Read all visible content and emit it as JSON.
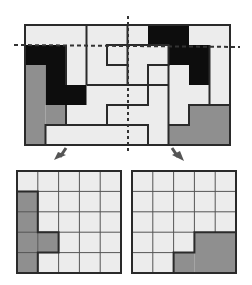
{
  "colors": {
    "light": "#ececec",
    "black": "#0d0d0d",
    "gray": "#8f8f8f",
    "line": "#2a2a2a",
    "arrow": "#555555"
  },
  "top_puzzle": {
    "cols": 10,
    "rows": 6,
    "pieces": [
      {
        "name": "black-piece-left",
        "fill": "black",
        "cells": [
          [
            0,
            1
          ],
          [
            1,
            1
          ],
          [
            1,
            2
          ],
          [
            1,
            3
          ],
          [
            2,
            3
          ]
        ]
      },
      {
        "name": "gray-piece-left",
        "fill": "gray",
        "cells": [
          [
            0,
            2
          ],
          [
            0,
            3
          ],
          [
            0,
            4
          ],
          [
            1,
            4
          ],
          [
            0,
            5
          ]
        ]
      },
      {
        "name": "black-piece-right",
        "fill": "black",
        "cells": [
          [
            6,
            0
          ],
          [
            7,
            0
          ],
          [
            7,
            1
          ],
          [
            8,
            1
          ],
          [
            8,
            2
          ]
        ]
      },
      {
        "name": "gray-piece-right",
        "fill": "gray",
        "cells": [
          [
            8,
            4
          ],
          [
            9,
            4
          ],
          [
            7,
            5
          ],
          [
            8,
            5
          ],
          [
            9,
            5
          ]
        ]
      }
    ],
    "cut_lines": [
      "horizontal-dashed-row1",
      "vertical-dashed-center"
    ]
  },
  "bottom_left_panel": {
    "cols": 5,
    "rows": 5,
    "gray_cells": [
      [
        0,
        1
      ],
      [
        0,
        2
      ],
      [
        0,
        3
      ],
      [
        1,
        3
      ],
      [
        0,
        4
      ]
    ]
  },
  "bottom_right_panel": {
    "cols": 5,
    "rows": 5,
    "gray_cells": [
      [
        3,
        3
      ],
      [
        4,
        3
      ],
      [
        2,
        4
      ],
      [
        3,
        4
      ],
      [
        4,
        4
      ]
    ]
  }
}
